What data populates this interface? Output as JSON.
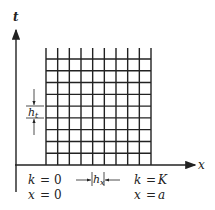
{
  "diagram": {
    "type": "finite-difference-grid",
    "axes": {
      "vertical_label": "t",
      "horizontal_label": "x"
    },
    "grid": {
      "columns": 9,
      "rows": 9,
      "x_left": 46,
      "x_right": 151,
      "y_top": 48,
      "y_first_row": 59,
      "y_bottom": 165,
      "line_color": "#222222"
    },
    "annotations": {
      "ht_label": "h",
      "ht_sub": "t",
      "hx_label": "h",
      "hx_sub": "x",
      "left_k": "k",
      "left_k_eq": "=",
      "left_k_val": "0",
      "left_x": "x",
      "left_x_eq": "=",
      "left_x_val": "0",
      "right_k": "k",
      "right_k_eq": "=",
      "right_k_val": "K",
      "right_x": "x",
      "right_x_eq": "=",
      "right_x_val": "a"
    }
  }
}
